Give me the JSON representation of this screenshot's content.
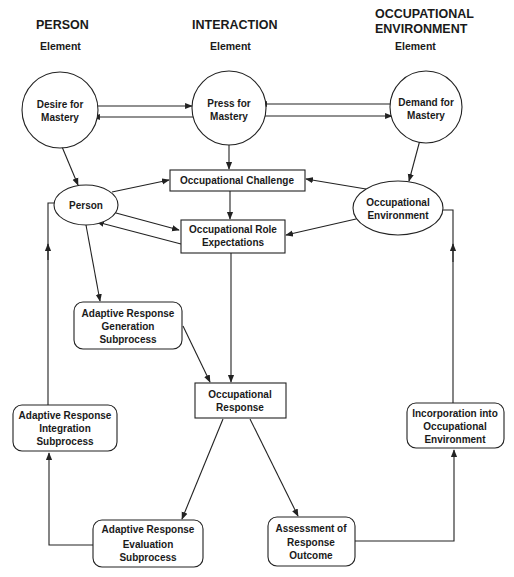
{
  "columns": {
    "person": {
      "title": "PERSON",
      "subtitle": "Element"
    },
    "interaction": {
      "title": "INTERACTION",
      "subtitle": "Element"
    },
    "environment": {
      "title_line1": "OCCUPATIONAL",
      "title_line2": "ENVIRONMENT",
      "subtitle": "Element"
    }
  },
  "nodes": {
    "desire": {
      "line1": "Desire for",
      "line2": "Mastery",
      "shape": "circle"
    },
    "press": {
      "line1": "Press for",
      "line2": "Mastery",
      "shape": "circle"
    },
    "demand": {
      "line1": "Demand for",
      "line2": "Mastery",
      "shape": "circle"
    },
    "challenge": {
      "line1": "Occupational Challenge",
      "shape": "rectangle"
    },
    "person": {
      "line1": "Person",
      "shape": "ellipse"
    },
    "role": {
      "line1": "Occupational Role",
      "line2": "Expectations",
      "shape": "rectangle"
    },
    "environment": {
      "line1": "Occupational",
      "line2": "Environment",
      "shape": "ellipse"
    },
    "generation": {
      "line1": "Adaptive Response",
      "line2": "Generation",
      "line3": "Subprocess",
      "shape": "rounded-rectangle"
    },
    "response": {
      "line1": "Occupational",
      "line2": "Response",
      "shape": "rectangle"
    },
    "integration": {
      "line1": "Adaptive Response",
      "line2": "Integration",
      "line3": "Subprocess",
      "shape": "rounded-rectangle"
    },
    "incorporation": {
      "line1": "Incorporation into",
      "line2": "Occupational",
      "line3": "Environment",
      "shape": "rounded-rectangle"
    },
    "evaluation": {
      "line1": "Adaptive Response",
      "line2": "Evaluation",
      "line3": "Subprocess",
      "shape": "rounded-rectangle"
    },
    "assessment": {
      "line1": "Assessment of",
      "line2": "Response",
      "line3": "Outcome",
      "shape": "rounded-rectangle"
    }
  },
  "edges": [
    {
      "from": "Desire for Mastery",
      "to": "Press for Mastery"
    },
    {
      "from": "Press for Mastery",
      "to": "Desire for Mastery"
    },
    {
      "from": "Demand for Mastery",
      "to": "Press for Mastery"
    },
    {
      "from": "Press for Mastery",
      "to": "Demand for Mastery"
    },
    {
      "from": "Desire for Mastery",
      "to": "Person"
    },
    {
      "from": "Press for Mastery",
      "to": "Occupational Challenge"
    },
    {
      "from": "Demand for Mastery",
      "to": "Occupational Environment"
    },
    {
      "from": "Person",
      "to": "Occupational Challenge"
    },
    {
      "from": "Occupational Environment",
      "to": "Occupational Challenge"
    },
    {
      "from": "Occupational Challenge",
      "to": "Occupational Role Expectations"
    },
    {
      "from": "Person",
      "to": "Occupational Role Expectations"
    },
    {
      "from": "Occupational Role Expectations",
      "to": "Person"
    },
    {
      "from": "Occupational Environment",
      "to": "Occupational Role Expectations"
    },
    {
      "from": "Person",
      "to": "Adaptive Response Generation Subprocess"
    },
    {
      "from": "Adaptive Response Generation Subprocess",
      "to": "Occupational Response"
    },
    {
      "from": "Occupational Role Expectations",
      "to": "Occupational Response"
    },
    {
      "from": "Occupational Response",
      "to": "Adaptive Response Evaluation Subprocess"
    },
    {
      "from": "Occupational Response",
      "to": "Assessment of Response Outcome"
    },
    {
      "from": "Adaptive Response Evaluation Subprocess",
      "to": "Adaptive Response Integration Subprocess"
    },
    {
      "from": "Adaptive Response Integration Subprocess",
      "to": "Person"
    },
    {
      "from": "Assessment of Response Outcome",
      "to": "Incorporation into Occupational Environment"
    },
    {
      "from": "Incorporation into Occupational Environment",
      "to": "Occupational Environment"
    }
  ],
  "colors": {
    "ink": "#222222",
    "background": "#ffffff"
  }
}
